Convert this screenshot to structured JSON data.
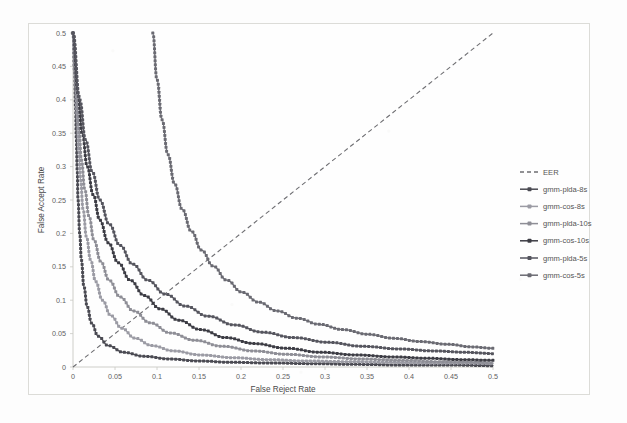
{
  "chart_data": {
    "type": "line",
    "title": "",
    "xlabel": "False Reject Rate",
    "ylabel": "False Accept Rate",
    "xlim": [
      0,
      0.5
    ],
    "ylim": [
      0,
      0.5
    ],
    "xticks": [
      "0",
      "0.05",
      "0.1",
      "0.15",
      "0.2",
      "0.25",
      "0.3",
      "0.35",
      "0.4",
      "0.45",
      "0.5"
    ],
    "yticks": [
      "0",
      "0.05",
      "0.1",
      "0.15",
      "0.2",
      "0.25",
      "0.3",
      "0.35",
      "0.4",
      "0.45",
      "0.5"
    ],
    "grid": false,
    "legend_position": "right",
    "series": [
      {
        "name": "EER",
        "style": "dashed",
        "color": "#6e6e72",
        "x": [
          0.0,
          0.5
        ],
        "y": [
          0.0,
          0.5
        ]
      },
      {
        "name": "gmm-plda-8s",
        "style": "marker-line",
        "color": "#4a4a52",
        "eer": 0.013,
        "x": [
          0.0,
          0.002,
          0.003,
          0.004,
          0.005,
          0.006,
          0.008,
          0.01,
          0.013,
          0.017,
          0.022,
          0.03,
          0.042,
          0.06,
          0.085,
          0.115,
          0.15,
          0.19,
          0.235,
          0.285,
          0.335,
          0.39,
          0.445,
          0.5
        ],
        "y": [
          0.5,
          0.44,
          0.39,
          0.34,
          0.295,
          0.25,
          0.2,
          0.16,
          0.12,
          0.09,
          0.066,
          0.046,
          0.032,
          0.022,
          0.016,
          0.012,
          0.009,
          0.007,
          0.006,
          0.005,
          0.004,
          0.003,
          0.003,
          0.002
        ]
      },
      {
        "name": "gmm-cos-8s",
        "style": "marker-line",
        "color": "#9b9ba4",
        "eer": 0.04,
        "x": [
          0.0,
          0.003,
          0.005,
          0.007,
          0.009,
          0.012,
          0.016,
          0.021,
          0.027,
          0.035,
          0.045,
          0.058,
          0.074,
          0.094,
          0.12,
          0.152,
          0.19,
          0.232,
          0.278,
          0.325,
          0.375,
          0.425,
          0.465,
          0.5
        ],
        "y": [
          0.5,
          0.43,
          0.375,
          0.325,
          0.28,
          0.236,
          0.195,
          0.16,
          0.128,
          0.1,
          0.077,
          0.058,
          0.043,
          0.032,
          0.024,
          0.018,
          0.014,
          0.011,
          0.009,
          0.008,
          0.007,
          0.006,
          0.006,
          0.005
        ]
      },
      {
        "name": "gmm-plda-10s",
        "style": "marker-line",
        "color": "#8e8e96",
        "eer": 0.055,
        "x": [
          0.0,
          0.004,
          0.007,
          0.01,
          0.014,
          0.019,
          0.025,
          0.033,
          0.043,
          0.056,
          0.072,
          0.092,
          0.116,
          0.145,
          0.178,
          0.215,
          0.255,
          0.298,
          0.342,
          0.388,
          0.432,
          0.47,
          0.5
        ],
        "y": [
          0.5,
          0.42,
          0.36,
          0.31,
          0.266,
          0.226,
          0.19,
          0.158,
          0.13,
          0.105,
          0.084,
          0.066,
          0.051,
          0.04,
          0.031,
          0.024,
          0.019,
          0.015,
          0.012,
          0.01,
          0.008,
          0.007,
          0.006
        ]
      },
      {
        "name": "gmm-cos-10s",
        "style": "marker-line",
        "color": "#3c3c44",
        "eer": 0.072,
        "x": [
          0.0,
          0.006,
          0.011,
          0.017,
          0.024,
          0.032,
          0.042,
          0.054,
          0.068,
          0.085,
          0.104,
          0.126,
          0.152,
          0.182,
          0.216,
          0.254,
          0.295,
          0.338,
          0.382,
          0.424,
          0.462,
          0.5
        ],
        "y": [
          0.5,
          0.41,
          0.35,
          0.3,
          0.258,
          0.22,
          0.186,
          0.156,
          0.13,
          0.107,
          0.087,
          0.07,
          0.056,
          0.044,
          0.035,
          0.028,
          0.022,
          0.018,
          0.015,
          0.013,
          0.011,
          0.01
        ]
      },
      {
        "name": "gmm-plda-5s",
        "style": "marker-line",
        "color": "#55555e",
        "eer": 0.09,
        "x": [
          0.0,
          0.008,
          0.015,
          0.023,
          0.032,
          0.043,
          0.056,
          0.071,
          0.089,
          0.11,
          0.134,
          0.161,
          0.192,
          0.226,
          0.263,
          0.303,
          0.345,
          0.388,
          0.43,
          0.468,
          0.5
        ],
        "y": [
          0.5,
          0.4,
          0.34,
          0.292,
          0.25,
          0.214,
          0.182,
          0.154,
          0.13,
          0.109,
          0.091,
          0.076,
          0.063,
          0.052,
          0.044,
          0.037,
          0.031,
          0.027,
          0.024,
          0.022,
          0.02
        ]
      },
      {
        "name": "gmm-cos-5s",
        "style": "marker-line",
        "color": "#6a6a72",
        "eer": 0.155,
        "x": [
          0.095,
          0.1,
          0.106,
          0.113,
          0.121,
          0.13,
          0.141,
          0.153,
          0.167,
          0.183,
          0.201,
          0.221,
          0.243,
          0.267,
          0.293,
          0.321,
          0.351,
          0.382,
          0.414,
          0.446,
          0.476,
          0.5
        ],
        "y": [
          0.5,
          0.43,
          0.37,
          0.318,
          0.274,
          0.236,
          0.203,
          0.175,
          0.151,
          0.13,
          0.112,
          0.097,
          0.084,
          0.073,
          0.064,
          0.056,
          0.049,
          0.043,
          0.038,
          0.034,
          0.03,
          0.028
        ]
      }
    ]
  },
  "legend": {
    "items": [
      {
        "label": "EER",
        "color": "#6e6e72",
        "dashed": true
      },
      {
        "label": "gmm-plda-8s",
        "color": "#4a4a52",
        "dashed": false
      },
      {
        "label": "gmm-cos-8s",
        "color": "#9b9ba4",
        "dashed": false
      },
      {
        "label": "gmm-plda-10s",
        "color": "#8e8e96",
        "dashed": false
      },
      {
        "label": "gmm-cos-10s",
        "color": "#3c3c44",
        "dashed": false
      },
      {
        "label": "gmm-plda-5s",
        "color": "#55555e",
        "dashed": false
      },
      {
        "label": "gmm-cos-5s",
        "color": "#6a6a72",
        "dashed": false
      }
    ]
  }
}
